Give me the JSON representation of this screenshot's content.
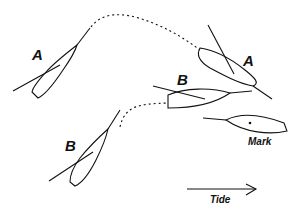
{
  "diagram": {
    "boats": [
      {
        "id": "A",
        "label": "A",
        "position": "start-left"
      },
      {
        "id": "A",
        "label": "A",
        "position": "end-right"
      },
      {
        "id": "B",
        "label": "B",
        "position": "start-left"
      },
      {
        "id": "B",
        "label": "B",
        "position": "end-right"
      }
    ],
    "mark": {
      "label": "Mark"
    },
    "tide": {
      "label": "Tide",
      "direction": "right"
    },
    "colors": {
      "ink": "#111111",
      "background": "#ffffff"
    }
  }
}
